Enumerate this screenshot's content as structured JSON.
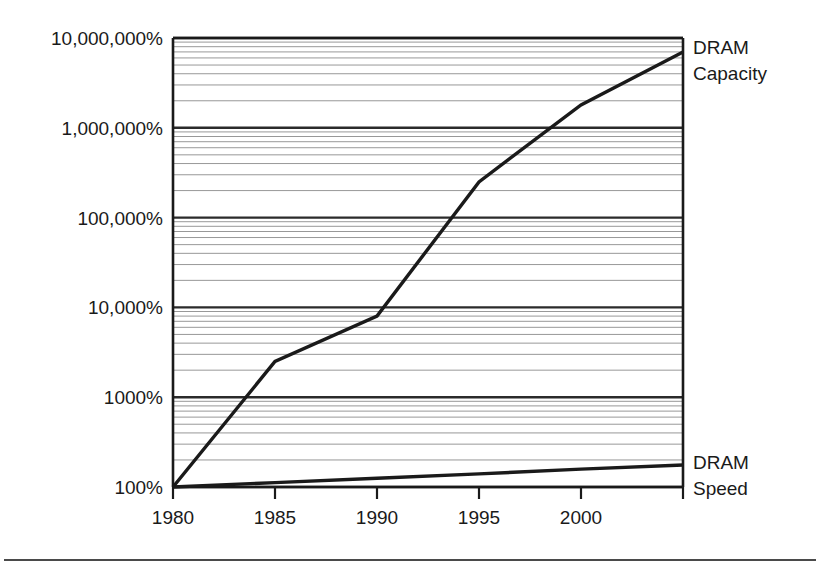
{
  "chart_data": {
    "type": "line",
    "title": "",
    "subtitle": "",
    "xlabel": "",
    "ylabel": "",
    "yscale": "log",
    "xscale": "linear",
    "xlim": [
      1980,
      2005
    ],
    "ylim": [
      100,
      10000000
    ],
    "grid": "horizontal log minor gridlines with emphasized decade lines",
    "legend_position": "right-of-plot inline labels at series endpoints",
    "x_ticks": [
      1980,
      1985,
      1990,
      1995,
      2000,
      2005
    ],
    "x_tick_labels": [
      "1980",
      "1985",
      "1990",
      "1995",
      "2000",
      ""
    ],
    "y_ticks": [
      100,
      1000,
      10000,
      100000,
      1000000,
      10000000
    ],
    "y_tick_labels": [
      "100%",
      "1000%",
      "10,000%",
      "100,000%",
      "1,000,000%",
      "10,000,000%"
    ],
    "series": [
      {
        "name": "DRAM Capacity",
        "label": "DRAM",
        "label_line2": "Capacity",
        "color": "#1a1a1a",
        "x": [
          1980,
          1985,
          1990,
          1995,
          2000,
          2005
        ],
        "values": [
          100,
          2500,
          8000,
          250000,
          1800000,
          7000000
        ]
      },
      {
        "name": "DRAM Speed",
        "label": "DRAM",
        "label_line2": "Speed",
        "color": "#1a1a1a",
        "x": [
          1980,
          1985,
          1990,
          1995,
          2000,
          2005
        ],
        "values": [
          100,
          112,
          125,
          140,
          158,
          176
        ]
      }
    ],
    "annotations": [
      {
        "text": "DRAM Capacity",
        "at_x": 2005,
        "at_y": 7000000
      },
      {
        "text": "DRAM Speed",
        "at_x": 2005,
        "at_y": 176
      }
    ]
  },
  "figure": {
    "background_color": "#ffffff",
    "line_color": "#1a1a1a",
    "gridline_color": "#8c8c8c",
    "decade_line_color": "#2b2b2b"
  }
}
